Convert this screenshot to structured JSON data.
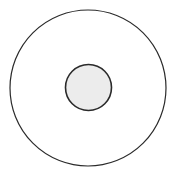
{
  "diagram": {
    "width": 172,
    "height": 174,
    "background": "#ffffff",
    "outer_circle": {
      "cx": 88,
      "cy": 88,
      "r": 78,
      "stroke": "#2a2a2a",
      "stroke_width": 1.2,
      "fill": "#ffffff"
    },
    "inner_circle": {
      "cx": 88.5,
      "cy": 87.5,
      "r": 23,
      "stroke": "#2a2a2a",
      "stroke_width": 1.6,
      "fill": "#ececec"
    }
  }
}
